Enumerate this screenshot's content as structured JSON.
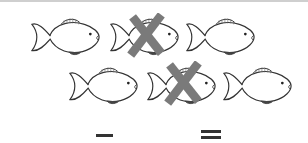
{
  "worksheet": {
    "fish_total": 6,
    "fish_crossed_out": 2,
    "rows": [
      {
        "fish": [
          {
            "crossed": false
          },
          {
            "crossed": true
          },
          {
            "crossed": false
          }
        ]
      },
      {
        "fish": [
          {
            "crossed": false
          },
          {
            "crossed": true
          },
          {
            "crossed": false
          }
        ]
      }
    ],
    "equation": {
      "operator": "−",
      "equals": "=",
      "first_blank": "",
      "second_blank": "",
      "answer_blank": ""
    },
    "colors": {
      "fish_outline": "#333333",
      "cross": "#7a7a7a",
      "background": "#ffffff"
    }
  }
}
